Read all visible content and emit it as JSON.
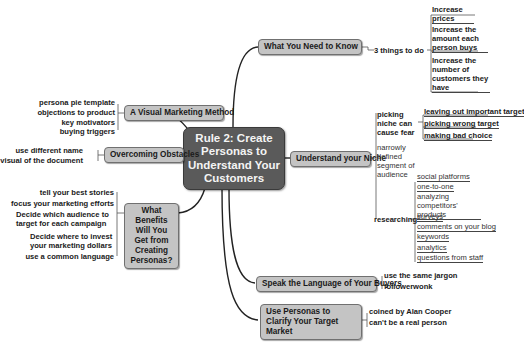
{
  "center": {
    "title": "Rule 2: Create Personas to Understand Your Customers"
  },
  "branches": {
    "need_to_know": {
      "label": "What You Need to Know",
      "sub": "3 things to do",
      "items": [
        "Increase prices",
        "Increase the amount each person buys",
        "Increase the number of customers they have"
      ]
    },
    "visual_method": {
      "label": "A Visual Marketing Method",
      "items": [
        "persona pie template",
        "objections to product",
        "key motivators",
        "buying triggers"
      ]
    },
    "obstacles": {
      "label": "Overcoming Obstacles",
      "items": [
        "use different name",
        "visual of the document"
      ]
    },
    "benefits": {
      "label": "What Benefits Will You Get from Creating Personas?",
      "items": [
        "tell your best stories",
        "focus your marketing efforts",
        "Decide which audience to target for each campaign",
        "Decide where to invest your marketing dollars",
        "use a common language"
      ]
    },
    "niche": {
      "label": "Understand your Niche",
      "fear": {
        "label": "picking niche can cause fear",
        "items": [
          "leaving out important target",
          "picking wrong target",
          "making bad choice"
        ]
      },
      "segment": "narrowly defined segment of audience",
      "research": {
        "label": "researching",
        "items": [
          "social platforms",
          "one-to-one",
          "analyzing competitors' products",
          "surveys",
          "comments on your blog",
          "keywords",
          "analytics",
          "questions from staff"
        ]
      }
    },
    "language": {
      "label": "Speak the Language of Your Buyers",
      "items": [
        "use the same jargon",
        "followerwonk"
      ]
    },
    "clarify": {
      "label": "Use Personas to Clarify Your Target Market",
      "items": [
        "coined by Alan Cooper",
        "can't be a real person"
      ]
    }
  }
}
